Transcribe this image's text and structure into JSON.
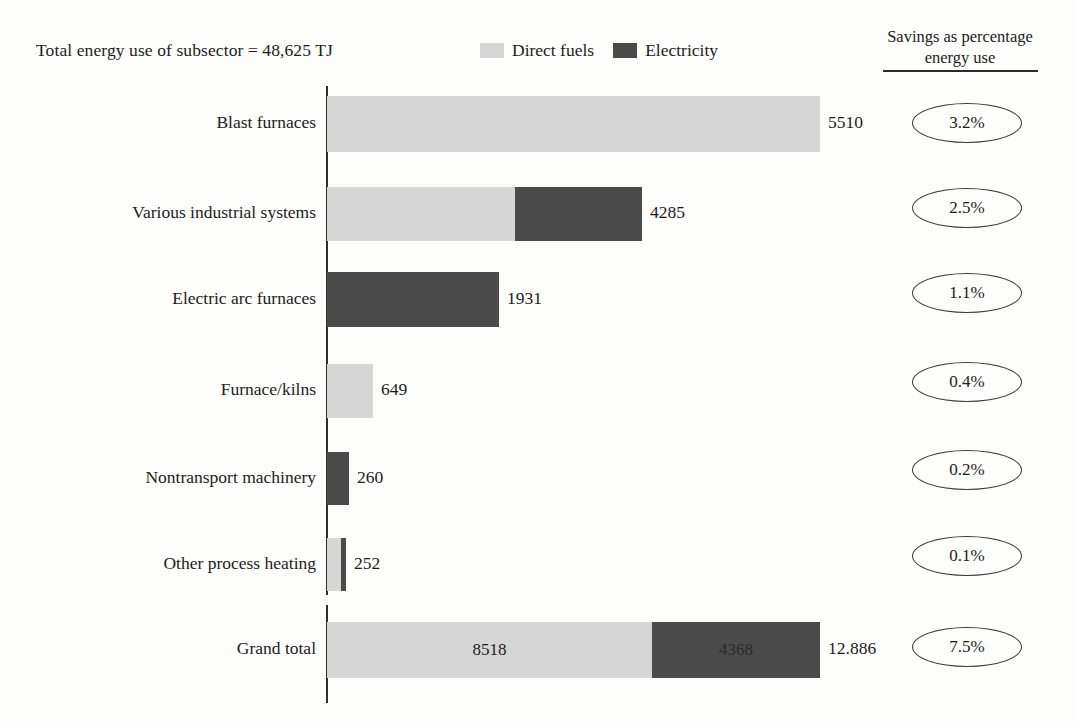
{
  "header": {
    "subsector_total": "Total energy use of subsector = 48,625 TJ",
    "savings_header_line1": "Savings as percentage",
    "savings_header_line2": "energy use"
  },
  "legend": {
    "items": [
      {
        "label": "Direct fuels",
        "color": "#d6d6d6",
        "key": "direct"
      },
      {
        "label": "Electricity",
        "color": "#4b4b4b",
        "key": "electric"
      }
    ]
  },
  "chart_data": {
    "type": "bar",
    "orientation": "horizontal",
    "stacked": true,
    "title": "Total energy use of subsector = 48,625 TJ",
    "xlabel": "",
    "ylabel": "",
    "grid": false,
    "legend_position": "top-center",
    "series": [
      {
        "name": "Direct fuels",
        "color": "#d6d6d6",
        "values": [
          5510,
          2556,
          0,
          649,
          0,
          240,
          8518
        ]
      },
      {
        "name": "Electricity",
        "color": "#4b4b4b",
        "values": [
          0,
          1729,
          1931,
          0,
          260,
          12,
          4368
        ]
      }
    ],
    "categories": [
      "Blast furnaces",
      "Various industrial systems",
      "Electric arc furnaces",
      "Furnace/kilns",
      "Nontransport machinery",
      "Other process heating",
      "Grand total"
    ],
    "totals": [
      5510,
      4285,
      1931,
      649,
      260,
      252,
      12886
    ],
    "total_labels": [
      "5510",
      "4285",
      "1931",
      "649",
      "260",
      "252",
      "12.886"
    ],
    "savings_percent": [
      "3.2%",
      "2.5%",
      "1.1%",
      "0.4%",
      "0.2%",
      "0.1%",
      "7.5%"
    ],
    "annotations": [
      {
        "row": "Grand total",
        "series": "Direct fuels",
        "text": "8518"
      },
      {
        "row": "Grand total",
        "series": "Electricity",
        "text": "4368"
      }
    ]
  },
  "rows": [
    {
      "label": "Blast furnaces",
      "total_label": "5510",
      "savings": "3.2%",
      "segments": [
        {
          "key": "direct",
          "width": 493,
          "value": ""
        }
      ],
      "top": 96,
      "height": 56,
      "oval_top": 103
    },
    {
      "label": "Various industrial systems",
      "total_label": "4285",
      "savings": "2.5%",
      "segments": [
        {
          "key": "direct",
          "width": 188,
          "value": ""
        },
        {
          "key": "electric",
          "width": 127,
          "value": ""
        }
      ],
      "top": 187,
      "height": 54,
      "oval_top": 188
    },
    {
      "label": "Electric arc furnaces",
      "total_label": "1931",
      "savings": "1.1%",
      "segments": [
        {
          "key": "electric",
          "width": 172,
          "value": ""
        }
      ],
      "top": 272,
      "height": 55,
      "oval_top": 273
    },
    {
      "label": "Furnace/kilns",
      "total_label": "649",
      "savings": "0.4%",
      "segments": [
        {
          "key": "direct",
          "width": 46,
          "value": ""
        }
      ],
      "top": 364,
      "height": 54,
      "oval_top": 362
    },
    {
      "label": "Nontransport machinery",
      "total_label": "260",
      "savings": "0.2%",
      "segments": [
        {
          "key": "electric",
          "width": 22,
          "value": ""
        }
      ],
      "top": 452,
      "height": 53,
      "oval_top": 450
    },
    {
      "label": "Other process heating",
      "total_label": "252",
      "savings": "0.1%",
      "segments": [
        {
          "key": "direct",
          "width": 14,
          "value": ""
        },
        {
          "key": "electric",
          "width": 5,
          "value": ""
        }
      ],
      "top": 538,
      "height": 53,
      "oval_top": 536
    },
    {
      "label": "Grand total",
      "total_label": "12.886",
      "savings": "7.5%",
      "segments": [
        {
          "key": "direct",
          "width": 325,
          "value": "8518"
        },
        {
          "key": "electric",
          "width": 168,
          "value": "4368"
        }
      ],
      "top": 622,
      "height": 56,
      "oval_top": 627
    }
  ]
}
